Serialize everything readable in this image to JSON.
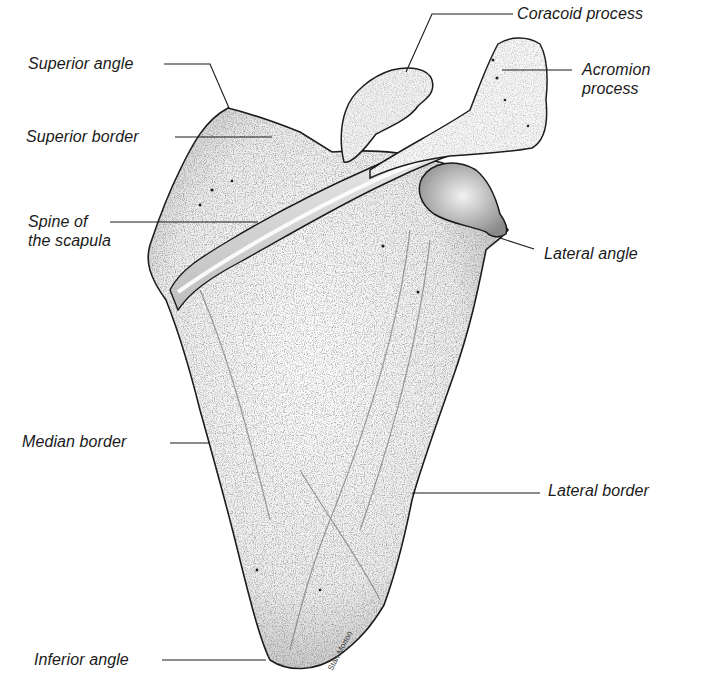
{
  "figure": {
    "labels": [
      {
        "id": "coracoid-process",
        "text": "Coracoid process"
      },
      {
        "id": "superior-angle",
        "text": "Superior angle"
      },
      {
        "id": "acromion-process",
        "text": "Acromion\nprocess"
      },
      {
        "id": "superior-border",
        "text": "Superior border"
      },
      {
        "id": "spine-of-the-scapula",
        "text": "Spine of\nthe scapula"
      },
      {
        "id": "lateral-angle",
        "text": "Lateral angle"
      },
      {
        "id": "median-border",
        "text": "Median border"
      },
      {
        "id": "lateral-border",
        "text": "Lateral border"
      },
      {
        "id": "inferior-angle",
        "text": "Inferior angle"
      }
    ],
    "signature": "Stan Morton"
  },
  "colors": {
    "ink": "#1a1a1a",
    "background": "#ffffff",
    "bone_light": "#f4f4f4",
    "bone_shade": "#9a9a9a"
  }
}
